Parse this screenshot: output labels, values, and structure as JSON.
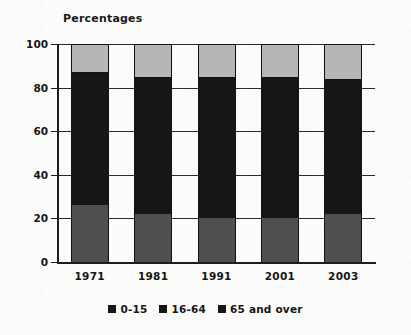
{
  "chart_data": {
    "type": "bar",
    "subtype": "stacked-vertical-percentage",
    "title": "Percentages",
    "xlabel": "",
    "ylabel": "",
    "ylim": [
      0,
      100
    ],
    "yticks": [
      0,
      20,
      40,
      60,
      80,
      100
    ],
    "ytick_labels": [
      "0",
      "20",
      "40",
      "60",
      "80",
      "100"
    ],
    "grid": true,
    "legend_position": "bottom-center",
    "categories": [
      "1971",
      "1981",
      "1991",
      "2001",
      "2003"
    ],
    "series": [
      {
        "name": "0-15",
        "color": "#4f4f4f",
        "values": [
          26,
          22,
          20,
          20,
          22
        ]
      },
      {
        "name": "16-64",
        "color": "#161616",
        "values": [
          61,
          63,
          65,
          65,
          62
        ]
      },
      {
        "name": "65 and over",
        "color": "#b6b6b6",
        "values": [
          13,
          15,
          15,
          15,
          16
        ]
      }
    ]
  },
  "legend": {
    "items": [
      {
        "label": "0-15",
        "color": "#161616"
      },
      {
        "label": "16-64",
        "color": "#161616"
      },
      {
        "label": "65 and over",
        "color": "#161616"
      }
    ]
  },
  "colors": {
    "background": "#fbfbf9",
    "axis": "#1d1d1d",
    "gridline": "#2a2a2a",
    "text": "#161616",
    "segment_young": "#4f4f4f",
    "segment_working": "#161616",
    "segment_old": "#b6b6b6"
  }
}
